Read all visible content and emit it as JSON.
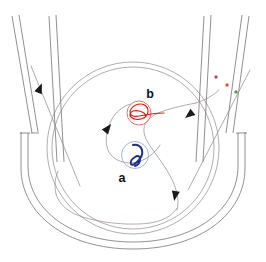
{
  "figure": {
    "kind": "particle-detector-event-display",
    "width": 266,
    "height": 262,
    "background_color": "#ffffff"
  },
  "labels": {
    "vertex_a": "a",
    "vertex_b": "b"
  },
  "colors": {
    "detector_outline": "#4a4a52",
    "vessel_wall": "#55555f",
    "primary_track": "#8d8a96",
    "secondary_track": "#a4848c",
    "decay_a_track": "#1b2f86",
    "decay_b_track": "#e01b12",
    "vertex_a_ring": "#9aaed4",
    "vertex_b_ring": "#e0544b",
    "arrowhead": "#1a1a1a",
    "hit_marker_1": "#a05a5a",
    "hit_marker_2": "#e2552c",
    "hit_marker_3": "#4f9a4f"
  },
  "hit_markers": [
    {
      "name": "hit-marker-maroon",
      "x": 216,
      "y": 77,
      "r": 1.7,
      "color": "#a05a5a"
    },
    {
      "name": "hit-marker-orange",
      "x": 227,
      "y": 85,
      "r": 1.7,
      "color": "#e2552c"
    },
    {
      "name": "hit-marker-green",
      "x": 236,
      "y": 92,
      "r": 1.7,
      "color": "#4f9a4f"
    }
  ],
  "vertices": [
    {
      "id": "a",
      "label": "a",
      "cx": 135,
      "cy": 155,
      "r": 13.5,
      "label_x": 122,
      "label_y": 182,
      "ring_color": "#9aaed4",
      "track_color": "#1b2f86"
    },
    {
      "id": "b",
      "label": "b",
      "cx": 139,
      "cy": 113,
      "r": 12.0,
      "label_x": 150,
      "label_y": 98,
      "ring_color": "#e0544b",
      "track_color": "#e01b12"
    }
  ],
  "arrowheads": [
    {
      "name": "arrowhead-upper-left",
      "x": 40,
      "y": 88,
      "angle": -68
    },
    {
      "name": "arrowhead-inner-left",
      "x": 108,
      "y": 128,
      "angle": -52
    },
    {
      "name": "arrowhead-upper-right",
      "x": 189,
      "y": 115,
      "angle": 206
    },
    {
      "name": "arrowhead-lower-right",
      "x": 175,
      "y": 196,
      "angle": 104
    }
  ],
  "geometry": {
    "inner_circle": {
      "cx": 133,
      "cy": 148,
      "r": 81
    },
    "inner_circle_2": {
      "cx": 133,
      "cy": 148,
      "r": 86
    },
    "vessel_arc_outer_r": 112,
    "vessel_arc_inner_r": 104
  }
}
